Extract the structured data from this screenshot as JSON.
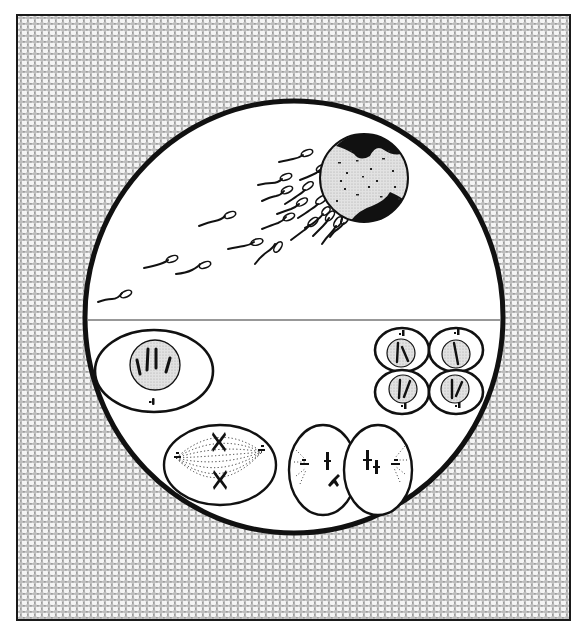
{
  "figure": {
    "frame": {
      "x": 17,
      "y": 15,
      "width": 553,
      "height": 605,
      "border_color": "#1a1a1a"
    },
    "colors": {
      "background_texture": "#9a9a9a",
      "texture_cells": "#f4f4f4",
      "ink": "#111111",
      "paper": "#ffffff",
      "nucleus_fill": "#d8d8d8"
    },
    "circle": {
      "cx": 294,
      "cy": 317,
      "rx": 209,
      "ry": 216,
      "stroke_width": 5
    },
    "divider": {
      "y": 320
    },
    "upper_panel": {
      "label": "fertilization",
      "egg": {
        "cx": 364,
        "cy": 178,
        "r": 44
      },
      "sperm_count": 20
    },
    "lower_panel": {
      "label": "cell division",
      "stages": [
        {
          "id": "interphase-cell",
          "name": "Interphase cell",
          "cx": 154,
          "cy": 371,
          "rx": 59,
          "ry": 41,
          "nucleus_r": 25,
          "chromosomes": 4
        },
        {
          "id": "metaphase-cell",
          "name": "Metaphase spindle cell",
          "cx": 220,
          "cy": 465,
          "rx": 56,
          "ry": 40
        },
        {
          "id": "telophase-cells",
          "name": "Two daughter cells",
          "cells": [
            {
              "cx": 323,
              "cy": 470,
              "rx": 34,
              "ry": 45
            },
            {
              "cx": 378,
              "cy": 470,
              "rx": 34,
              "ry": 45
            }
          ]
        },
        {
          "id": "four-cell-stage",
          "name": "Four daughter cells",
          "cells": [
            {
              "cx": 402,
              "cy": 350
            },
            {
              "cx": 456,
              "cy": 350
            },
            {
              "cx": 402,
              "cy": 392
            },
            {
              "cx": 456,
              "cy": 392
            }
          ]
        }
      ]
    },
    "caption": ""
  }
}
